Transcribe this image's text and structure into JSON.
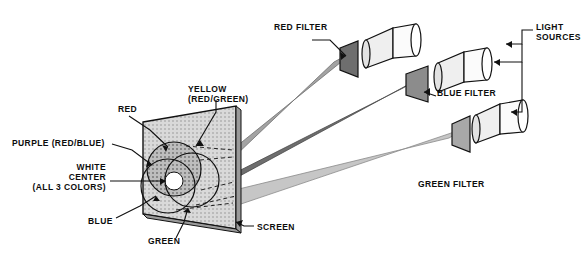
{
  "figure": {
    "type": "optics-diagram",
    "background": "#ffffff",
    "ink": "#0d0d0d"
  },
  "colors": {
    "screen_face": "#d9d9d9",
    "screen_edge": "#9a9a9a",
    "red_beam": "#9e9e9e",
    "blue_beam": "#6a6a6a",
    "green_beam": "#bdbdbd",
    "filter_dark": "#6e6e6e",
    "filter_mid": "#8c8c8c",
    "lamp_body": "#e8e8e8",
    "outline": "#111111"
  },
  "labels": [
    {
      "name": "red-filter",
      "text": "RED FILTER",
      "x": 274,
      "y": 27,
      "align": "left"
    },
    {
      "name": "light-sources",
      "text": "LIGHT\nSOURCES",
      "x": 536,
      "y": 27,
      "align": "left"
    },
    {
      "name": "blue-filter",
      "text": "BLUE FILTER",
      "x": 437,
      "y": 92,
      "align": "left"
    },
    {
      "name": "yellow-red-green",
      "text": "YELLOW\n(RED/GREEN)",
      "x": 188,
      "y": 88,
      "align": "left"
    },
    {
      "name": "red",
      "text": "RED",
      "x": 118,
      "y": 108,
      "align": "left"
    },
    {
      "name": "purple-red-blue",
      "text": "PURPLE (RED/BLUE)",
      "x": 14,
      "y": 142,
      "align": "left"
    },
    {
      "name": "white-center",
      "text": "WHITE\nCENTER\n(ALL 3 COLORS)",
      "x": 46,
      "y": 168,
      "align": "left"
    },
    {
      "name": "green-filter",
      "text": "GREEN FILTER",
      "x": 418,
      "y": 183,
      "align": "left"
    },
    {
      "name": "blue",
      "text": "BLUE",
      "x": 92,
      "y": 222,
      "align": "left"
    },
    {
      "name": "green",
      "text": "GREEN",
      "x": 152,
      "y": 241,
      "align": "left"
    },
    {
      "name": "screen",
      "text": "SCREEN",
      "x": 257,
      "y": 228,
      "align": "left"
    }
  ],
  "elements": {
    "screen": "projection screen panel (parallelogram)",
    "circles": [
      "red circle",
      "blue circle",
      "green circle"
    ],
    "lamps": [
      "red lamp",
      "blue lamp",
      "green lamp"
    ],
    "filters": [
      "red filter plate",
      "blue filter plate",
      "green filter plate"
    ]
  }
}
